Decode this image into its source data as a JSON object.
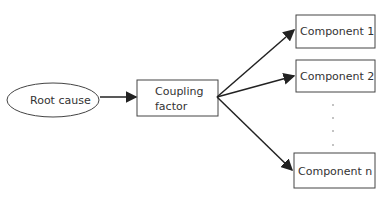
{
  "diagram": {
    "root": {
      "label": "Root cause"
    },
    "coupling": {
      "line1": "Coupling",
      "line2": "factor"
    },
    "components": [
      {
        "label": "Component 1"
      },
      {
        "label": "Component 2"
      },
      {
        "label": "Component n"
      }
    ],
    "ellipsis": "· · · ·"
  }
}
